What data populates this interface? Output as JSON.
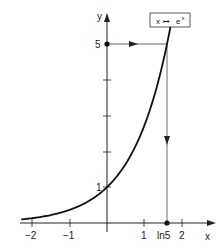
{
  "chart_data": {
    "type": "line",
    "title": "",
    "function_label": "x ↦ eˣ",
    "function_label_parts": {
      "lhs": "x",
      "arrow": "↦",
      "base": "e",
      "exp": "x"
    },
    "xlabel": "x",
    "ylabel": "y",
    "xlim": [
      -2.3,
      2.8
    ],
    "ylim": [
      0,
      5.4
    ],
    "grid": false,
    "x_ticks": [
      -2,
      -1,
      1,
      2
    ],
    "x_tick_labels": [
      "−2",
      "−1",
      "1",
      "2"
    ],
    "y_ticks": [
      1,
      2,
      3,
      4,
      5
    ],
    "y_tick_labels": [
      "1",
      "",
      "",
      "",
      "5"
    ],
    "special_point_x": {
      "value": 1.609,
      "label": "ln5"
    },
    "series": [
      {
        "name": "e^x",
        "x": [
          -2.3,
          -2,
          -1.5,
          -1,
          -0.5,
          0,
          0.5,
          1,
          1.25,
          1.5,
          1.609,
          1.7
        ],
        "y": [
          0.1,
          0.135,
          0.223,
          0.368,
          0.607,
          1.0,
          1.649,
          2.718,
          3.49,
          4.48,
          5.0,
          5.47
        ]
      }
    ],
    "annotations": [
      {
        "type": "arrow-horizontal",
        "from": [
          0,
          5
        ],
        "to": [
          1.609,
          5
        ],
        "text": ""
      },
      {
        "type": "arrow-vertical",
        "from": [
          1.609,
          5
        ],
        "to": [
          1.609,
          0
        ],
        "text": ""
      },
      {
        "type": "point",
        "at": [
          0,
          5
        ]
      },
      {
        "type": "point",
        "at": [
          1.609,
          0
        ]
      }
    ]
  }
}
